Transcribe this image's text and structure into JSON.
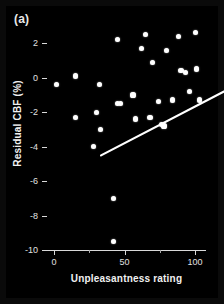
{
  "figure": {
    "panel_label": "(a)",
    "background_color": "#000000",
    "foreground_color": "#ffffff"
  },
  "chart_data": {
    "type": "scatter",
    "title": "",
    "panel": "(a)",
    "xlabel": "Unpleasantness rating",
    "ylabel": "Residual CBF (%)",
    "xlim": [
      -5,
      107
    ],
    "ylim": [
      -10,
      3
    ],
    "xticks": [
      0,
      50,
      100
    ],
    "xtick_labels": [
      "0",
      "50",
      "100"
    ],
    "yticks": [
      2,
      0,
      -2,
      -4,
      -6,
      -8,
      -10
    ],
    "ytick_labels": [
      "2",
      "0",
      "-2",
      "-4",
      "-6",
      "-8",
      "-10"
    ],
    "grid": false,
    "legend": false,
    "marker_color": "#ffffff",
    "marker_shape": "circle",
    "points": [
      {
        "x": 2,
        "y": -0.4
      },
      {
        "x": 15,
        "y": 0.1
      },
      {
        "x": 15,
        "y": -2.3
      },
      {
        "x": 32,
        "y": -0.4
      },
      {
        "x": 30,
        "y": -2.0
      },
      {
        "x": 28,
        "y": -4.0
      },
      {
        "x": 33,
        "y": -3.0
      },
      {
        "x": 45,
        "y": 2.2
      },
      {
        "x": 45,
        "y": -1.5
      },
      {
        "x": 47,
        "y": -1.5
      },
      {
        "x": 42,
        "y": -7.0
      },
      {
        "x": 42,
        "y": -9.5
      },
      {
        "x": 56,
        "y": -1.0
      },
      {
        "x": 58,
        "y": -2.4
      },
      {
        "x": 62,
        "y": 1.7
      },
      {
        "x": 65,
        "y": 2.5
      },
      {
        "x": 68,
        "y": -2.3
      },
      {
        "x": 70,
        "y": 0.9
      },
      {
        "x": 74,
        "y": -1.4
      },
      {
        "x": 76,
        "y": -2.7
      },
      {
        "x": 78,
        "y": -2.8
      },
      {
        "x": 80,
        "y": 1.6
      },
      {
        "x": 84,
        "y": -1.3
      },
      {
        "x": 88,
        "y": 2.4
      },
      {
        "x": 90,
        "y": 0.4
      },
      {
        "x": 93,
        "y": 0.3
      },
      {
        "x": 96,
        "y": -0.8
      },
      {
        "x": 100,
        "y": 2.6
      },
      {
        "x": 101,
        "y": 0.5
      },
      {
        "x": 103,
        "y": -1.3
      }
    ],
    "fit_line": {
      "type": "linear-regression",
      "color": "#ffffff",
      "x_start": 0,
      "y_start": -3.0,
      "x_end": 100,
      "y_end": 1.25
    }
  }
}
